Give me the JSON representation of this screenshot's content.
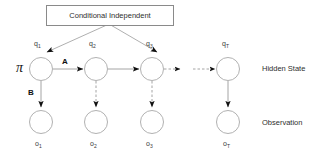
{
  "figure": {
    "background_color": "#ffffff",
    "line_color": "#8f8f8f",
    "arrow_color": "#101010",
    "text_color": "#303030"
  },
  "callout": {
    "label": "Conditional Independent",
    "points_to": [
      "q1",
      "q3"
    ]
  },
  "parameters": {
    "initial": "π",
    "transition": "A",
    "emission": "B"
  },
  "row_labels": {
    "hidden": "Hidden State",
    "observation": "Observation"
  },
  "hidden_states": [
    {
      "id": "q1",
      "label": "q",
      "sub": "1"
    },
    {
      "id": "q2",
      "label": "q",
      "sub": "2"
    },
    {
      "id": "q3",
      "label": "q",
      "sub": "3"
    },
    {
      "id": "qT",
      "label": "q",
      "sub": "T"
    }
  ],
  "observations": [
    {
      "id": "o1",
      "label": "o",
      "sub": "1"
    },
    {
      "id": "o2",
      "label": "o",
      "sub": "2"
    },
    {
      "id": "o3",
      "label": "o",
      "sub": "3"
    },
    {
      "id": "oT",
      "label": "o",
      "sub": "T"
    }
  ],
  "ellipsis": {
    "type": "dashed-skip",
    "between": [
      "q3",
      "qT"
    ]
  }
}
